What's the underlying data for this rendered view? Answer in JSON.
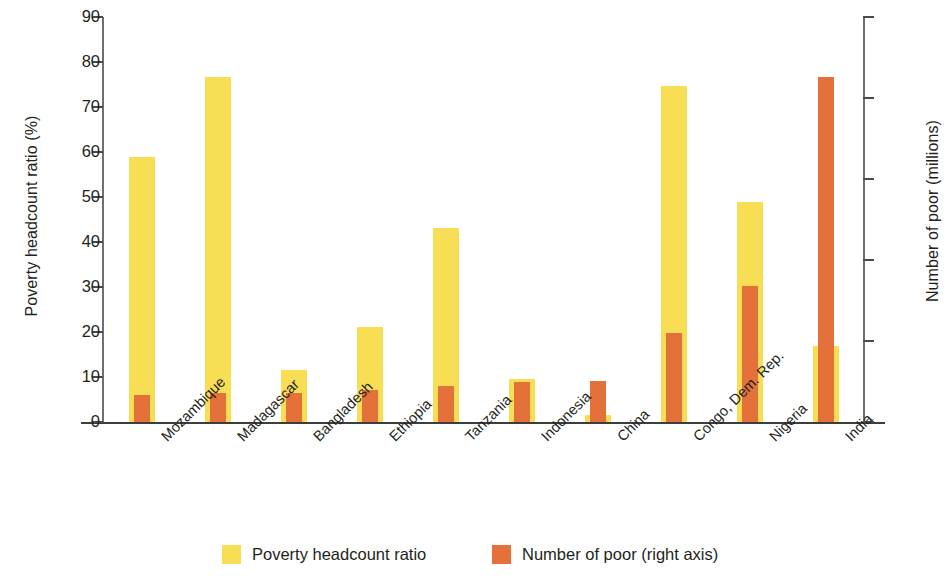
{
  "chart_data": {
    "type": "bar",
    "title": "",
    "xlabel": "",
    "ylabel": "Poverty headcount ratio (%)",
    "y2label": "Number of poor (millions)",
    "ylim": [
      0,
      90
    ],
    "y2lim": [
      0,
      250
    ],
    "yticks": [
      0,
      10,
      20,
      30,
      40,
      50,
      60,
      70,
      80,
      90
    ],
    "y2ticks": [
      0,
      50,
      100,
      150,
      200,
      250
    ],
    "grid": false,
    "legend_position": "bottom",
    "categories": [
      "Mozambique",
      "Madagascar",
      "Bangladesh",
      "Ethiopia",
      "Tanzania",
      "Indonesia",
      "China",
      "Congo, Dem. Rep.",
      "Nigeria",
      "India"
    ],
    "series": [
      {
        "name": "Poverty headcount ratio",
        "axis": "left",
        "unit": "%",
        "color": "#f7de54",
        "values": [
          59.0,
          76.7,
          11.5,
          21.2,
          43.1,
          9.5,
          1.6,
          74.7,
          49.0,
          17.0
        ]
      },
      {
        "name": "Number of poor (right axis)",
        "axis": "right",
        "unit": "millions",
        "color": "#e4713a",
        "values": [
          16.5,
          18.0,
          18.0,
          20.0,
          22.0,
          25.0,
          25.5,
          55.0,
          84.0,
          213.0
        ]
      }
    ]
  },
  "legend": {
    "items": [
      {
        "label": "Poverty headcount ratio",
        "color": "#f7de54"
      },
      {
        "label": "Number of poor (right axis)",
        "color": "#e4713a"
      }
    ]
  },
  "colors": {
    "yellow": "#f7de54",
    "orange": "#e4713a",
    "axis": "#3d3d3d",
    "text": "#231f20",
    "background": "#ffffff"
  }
}
